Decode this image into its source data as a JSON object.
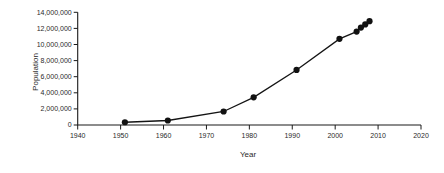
{
  "chart_data": {
    "type": "line",
    "title": "",
    "xlabel": "Year",
    "ylabel": "Population",
    "series_name": "Population",
    "x": [
      1951,
      1961,
      1974,
      1981,
      1991,
      2001,
      2005,
      2006,
      2007,
      2008
    ],
    "y": [
      340000,
      560000,
      1680000,
      3440000,
      6840000,
      10700000,
      11600000,
      12100000,
      12500000,
      12900000
    ],
    "xlim": [
      1940,
      2020
    ],
    "ylim": [
      0,
      14000000
    ],
    "x_ticks": [
      1940,
      1950,
      1960,
      1970,
      1980,
      1990,
      2000,
      2010,
      2020
    ],
    "y_ticks": [
      0,
      2000000,
      4000000,
      6000000,
      8000000,
      10000000,
      12000000,
      14000000
    ],
    "y_tick_labels": [
      "0",
      "2,000,000",
      "4,000,000",
      "6,000,000",
      "8,000,000",
      "10,000,000",
      "12,000,000",
      "14,000,000"
    ],
    "grid": false,
    "legend": null,
    "marker": "circle",
    "colors": {
      "line": "#141414",
      "marker": "#111111",
      "axis": "#1a1a1a",
      "text": "#2a2a2a",
      "background": "#ffffff"
    }
  }
}
